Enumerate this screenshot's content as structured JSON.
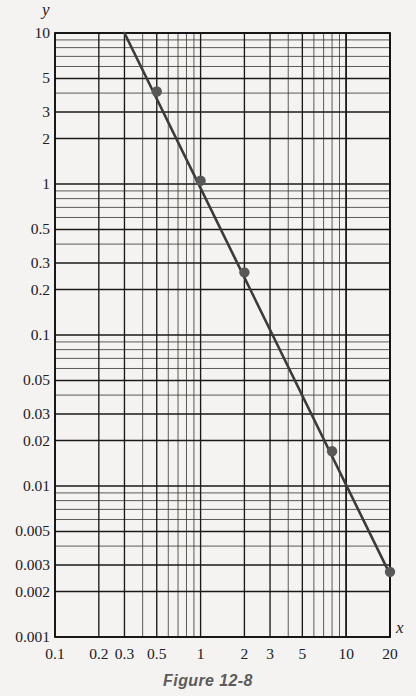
{
  "figure": {
    "caption": "Figure 12-8",
    "x_axis_name": "x",
    "y_axis_name": "y"
  },
  "chart_data": {
    "type": "line",
    "title": "",
    "subtitle": "",
    "xlabel": "x",
    "ylabel": "y",
    "xscale": "log",
    "yscale": "log",
    "xlim": [
      0.1,
      20
    ],
    "ylim": [
      0.001,
      10
    ],
    "grid": true,
    "legend": null,
    "x_tick_labels": [
      "0.1",
      "0.2",
      "0.3",
      "0.5",
      "1",
      "2",
      "3",
      "5",
      "10",
      "20"
    ],
    "x_tick_values": [
      0.1,
      0.2,
      0.3,
      0.5,
      1,
      2,
      3,
      5,
      10,
      20
    ],
    "y_tick_labels": [
      "10",
      "5",
      "3",
      "2",
      "1",
      "0.5",
      "0.3",
      "0.2",
      "0.1",
      "0.05",
      "0.03",
      "0.02",
      "0.01",
      "0.005",
      "0.003",
      "0.002",
      "0.001"
    ],
    "y_tick_values": [
      10,
      5,
      3,
      2,
      1,
      0.5,
      0.3,
      0.2,
      0.1,
      0.05,
      0.03,
      0.02,
      0.01,
      0.005,
      0.003,
      0.002,
      0.001
    ],
    "series": [
      {
        "name": "fitted-line",
        "type": "line",
        "color": "#3b3b3b",
        "x": [
          0.3,
          20
        ],
        "y": [
          10,
          0.0026
        ]
      },
      {
        "name": "data-points",
        "type": "scatter",
        "color": "#585858",
        "x": [
          0.5,
          1,
          2,
          8,
          20
        ],
        "y": [
          4.1,
          1.05,
          0.26,
          0.017,
          0.0027
        ]
      }
    ]
  },
  "colors": {
    "background": "#f4f3f1",
    "grid": "#2a2a28",
    "frame": "#111111",
    "curve": "#3b3b3b",
    "marker": "#5a5a5a",
    "text": "#20201e",
    "caption": "#5c5c5a"
  }
}
